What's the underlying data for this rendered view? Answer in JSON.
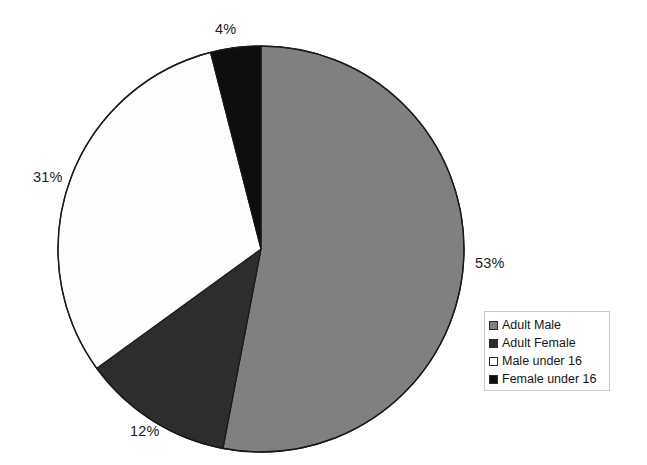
{
  "chart_data": {
    "type": "pie",
    "title": "",
    "subtitle": "",
    "xlabel": "",
    "ylabel": "",
    "categories": [
      "Adult Male",
      "Adult Female",
      "Male under 16",
      "Female under 16"
    ],
    "values": [
      53,
      12,
      31,
      4
    ],
    "value_unit": "%",
    "data_labels": [
      "53%",
      "12%",
      "31%",
      "4%"
    ],
    "colors": [
      "#808080",
      "#2d2d2d",
      "#fdfdfd",
      "#0d0d0d"
    ],
    "slice_start_angle_deg": 0,
    "slice_direction": "clockwise",
    "grid": false,
    "legend": {
      "position": "bottom-right",
      "border_color": "#c9c9c9",
      "entries": [
        {
          "label": "Adult Male",
          "color": "#808080"
        },
        {
          "label": "Adult Female",
          "color": "#2d2d2d"
        },
        {
          "label": "Male under 16",
          "color": "#fdfdfd"
        },
        {
          "label": "Female under 16",
          "color": "#0d0d0d"
        }
      ]
    },
    "geometry": {
      "center_x": 261,
      "center_y": 249,
      "radius": 203,
      "outline_color": "#1a1a1a"
    },
    "background_color": "#ffffff"
  }
}
